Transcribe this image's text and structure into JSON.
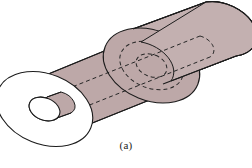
{
  "figure": {
    "caption": "(a)",
    "projection": "oblique-isometric",
    "background_color": "#ffffff",
    "line_color": "#1c1c1c",
    "hidden_line_color": "#262626",
    "body_fill_large": "#bda8a8",
    "body_fill_small": "#c3b0b0",
    "end_face_fill": "#ffffff",
    "bore_face_fill": "#ffffff",
    "line_width": 1.1,
    "hidden_dash_pattern": "4,3",
    "parts": [
      {
        "name": "large-diameter-cylinder",
        "note": "left section, larger outer diameter, open annular end face at far left"
      },
      {
        "name": "small-diameter-cylinder",
        "note": "right section, reduced outer diameter, rounded closed end at far right"
      },
      {
        "name": "shoulder-step",
        "note": "annular step where the large cylinder terminates against the small cylinder"
      },
      {
        "name": "through-bore",
        "note": "central axial hole shown with dashed hidden lines running the full length"
      }
    ],
    "geometry": {
      "axis_start": [
        42,
        110
      ],
      "axis_end": [
        222,
        37
      ],
      "large_outer_radius": 35,
      "large_inner_radius": 13,
      "small_outer_radius": 22,
      "bore_radius": 11,
      "step_position": [
        148,
        65
      ]
    }
  }
}
